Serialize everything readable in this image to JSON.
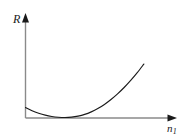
{
  "figure": {
    "background_color": "#ffffff",
    "axis_color": "#8a8a8a",
    "curve_color": "#1a1a1a"
  },
  "labels": {
    "y_axis": "R",
    "x_axis_symbol": "n",
    "x_axis_subscript": "1",
    "x_axis_full": "n1"
  },
  "chart_data": {
    "type": "line",
    "title": "",
    "subtitle": "",
    "xlabel": "n1",
    "ylabel": "R",
    "grid": false,
    "legend": null,
    "annotations": [],
    "xticks": [],
    "yticks": [],
    "xlim": [
      0,
      1
    ],
    "ylim": [
      0,
      1
    ],
    "series": [
      {
        "name": "R(n1)",
        "color": "#1a1a1a",
        "x": [
          0.0,
          0.05,
          0.1,
          0.15,
          0.2,
          0.25,
          0.3,
          0.35,
          0.4,
          0.45,
          0.5,
          0.55,
          0.6,
          0.65,
          0.7,
          0.75,
          0.8,
          0.85,
          0.9
        ],
        "y": [
          0.145,
          0.098,
          0.062,
          0.034,
          0.015,
          0.004,
          0.0,
          0.005,
          0.02,
          0.045,
          0.082,
          0.13,
          0.19,
          0.262,
          0.345,
          0.438,
          0.542,
          0.655,
          0.78
        ]
      }
    ],
    "minimum_point": {
      "x": 0.3,
      "y": 0.0
    }
  }
}
